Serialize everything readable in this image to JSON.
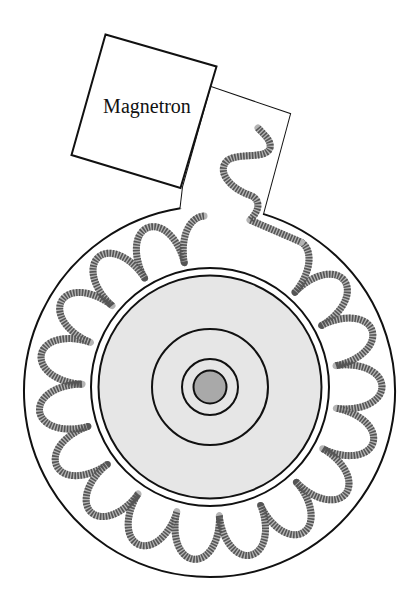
{
  "diagram": {
    "magnetron": {
      "label": "Magnetron",
      "corners": [
        [
          105.5,
          34.5
        ],
        [
          216.5,
          66.5
        ],
        [
          180.5,
          188
        ],
        [
          71.5,
          155
        ]
      ],
      "label_pos": [
        147,
        113
      ],
      "label_rotate": 0
    },
    "waveguide": {
      "outline": [
        [
          183,
          187
        ],
        [
          179,
          199
        ]
      ],
      "top_left": [
        211,
        87
      ],
      "top_right": [
        290,
        114
      ],
      "bottom_right": [
        266,
        204
      ]
    },
    "cavity": {
      "center": [
        209.5,
        391.5
      ],
      "radius": 185.5,
      "gap_start_point": [
        179,
        199
      ],
      "gap_end_point": [
        266,
        204
      ]
    },
    "inner_vessel": {
      "center": [
        210,
        387
      ],
      "ring_outer_radius": 119,
      "ring_inner_radius": 111.5,
      "fill_color": "#e6e6e6",
      "rings": [
        {
          "name": "middle-ring",
          "radius": 58
        },
        {
          "name": "inner-ring",
          "radius": 28
        }
      ],
      "core": {
        "radius": 16.5,
        "fill_color": "#a9a9a9"
      }
    },
    "coil_tube": {
      "center": [
        210,
        388
      ],
      "r_min": 128,
      "r_max": 172,
      "start_angle_deg": -58,
      "end_angle_deg": 268,
      "lobes": 17,
      "lead_in": "M258,128 C262,133 272,140 270,148 C266,160 240,152 228,160 C216,170 228,188 252,196 C262,202 258,212 250,220",
      "tube_width": 7,
      "base_color": "#b4b4b4",
      "stripe_color": "#555555",
      "stripe_dash": [
        1.6,
        1.3
      ]
    },
    "line_color": "#111111"
  }
}
